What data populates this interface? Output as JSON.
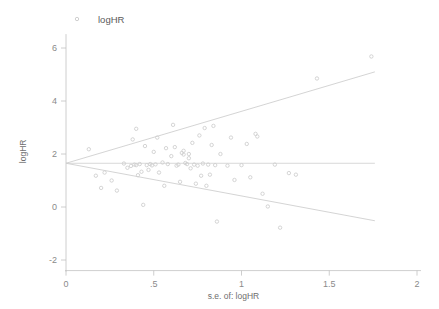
{
  "chart_data": {
    "type": "scatter",
    "title": "",
    "subtitle": "",
    "xlabel": "s.e. of: logHR",
    "ylabel": "logHR",
    "xlim": [
      0,
      2
    ],
    "ylim": [
      -2.4,
      6.6
    ],
    "xticks": [
      0,
      0.5,
      1,
      1.5,
      2
    ],
    "xtick_labels": [
      "0",
      ".5",
      "1",
      "1.5",
      "2"
    ],
    "yticks": [
      -2,
      0,
      2,
      4,
      6
    ],
    "ytick_labels": [
      "-2",
      "0",
      "2",
      "4",
      "6"
    ],
    "grid": false,
    "legend": {
      "position": "top-left",
      "entries": [
        {
          "label": "logHR",
          "marker": "circle",
          "color": "#c9c9c9"
        }
      ]
    },
    "marker": {
      "shape": "circle-open",
      "color": "#cfcfcf",
      "size": 3.4
    },
    "reference_lines": [
      {
        "name": "pooled-effect-line",
        "kind": "horizontal",
        "y": 1.65,
        "x_start": 0.0,
        "x_end": 1.76,
        "color": "#cfcfcf"
      },
      {
        "name": "pseudo-95-ci-upper",
        "kind": "diagonal",
        "x_start": 0.0,
        "y_start": 1.65,
        "x_end": 1.76,
        "y_end": 5.1,
        "color": "#cfcfcf"
      },
      {
        "name": "pseudo-95-ci-lower",
        "kind": "diagonal",
        "x_start": 0.0,
        "y_start": 1.65,
        "x_end": 1.76,
        "y_end": -0.52,
        "color": "#cfcfcf"
      }
    ],
    "series": [
      {
        "name": "logHR",
        "points": [
          [
            0.13,
            2.18
          ],
          [
            0.17,
            1.18
          ],
          [
            0.2,
            0.72
          ],
          [
            0.22,
            1.3
          ],
          [
            0.26,
            1.0
          ],
          [
            0.29,
            0.62
          ],
          [
            0.33,
            1.64
          ],
          [
            0.35,
            1.48
          ],
          [
            0.37,
            1.55
          ],
          [
            0.38,
            2.55
          ],
          [
            0.39,
            1.6
          ],
          [
            0.4,
            2.95
          ],
          [
            0.4,
            1.58
          ],
          [
            0.41,
            1.2
          ],
          [
            0.42,
            1.62
          ],
          [
            0.43,
            1.33
          ],
          [
            0.44,
            0.08
          ],
          [
            0.45,
            2.3
          ],
          [
            0.46,
            1.58
          ],
          [
            0.47,
            1.4
          ],
          [
            0.48,
            1.62
          ],
          [
            0.49,
            1.57
          ],
          [
            0.5,
            2.08
          ],
          [
            0.51,
            1.61
          ],
          [
            0.52,
            2.62
          ],
          [
            0.53,
            1.3
          ],
          [
            0.55,
            1.68
          ],
          [
            0.56,
            0.8
          ],
          [
            0.57,
            2.22
          ],
          [
            0.58,
            1.62
          ],
          [
            0.6,
            1.92
          ],
          [
            0.61,
            3.1
          ],
          [
            0.62,
            2.26
          ],
          [
            0.63,
            1.56
          ],
          [
            0.64,
            1.6
          ],
          [
            0.65,
            0.95
          ],
          [
            0.66,
            2.04
          ],
          [
            0.67,
            1.98
          ],
          [
            0.67,
            2.12
          ],
          [
            0.68,
            1.66
          ],
          [
            0.69,
            1.62
          ],
          [
            0.7,
            2.0
          ],
          [
            0.7,
            1.84
          ],
          [
            0.71,
            1.46
          ],
          [
            0.72,
            2.42
          ],
          [
            0.73,
            1.6
          ],
          [
            0.74,
            0.88
          ],
          [
            0.75,
            1.56
          ],
          [
            0.76,
            2.7
          ],
          [
            0.77,
            1.18
          ],
          [
            0.78,
            1.64
          ],
          [
            0.79,
            2.98
          ],
          [
            0.8,
            0.8
          ],
          [
            0.81,
            1.6
          ],
          [
            0.82,
            1.22
          ],
          [
            0.83,
            2.34
          ],
          [
            0.84,
            3.06
          ],
          [
            0.85,
            1.58
          ],
          [
            0.86,
            -0.55
          ],
          [
            0.88,
            2.0
          ],
          [
            0.92,
            1.56
          ],
          [
            0.94,
            2.62
          ],
          [
            0.96,
            1.02
          ],
          [
            1.0,
            1.58
          ],
          [
            1.03,
            2.38
          ],
          [
            1.05,
            1.12
          ],
          [
            1.08,
            2.76
          ],
          [
            1.09,
            2.66
          ],
          [
            1.12,
            0.5
          ],
          [
            1.15,
            0.02
          ],
          [
            1.19,
            1.6
          ],
          [
            1.22,
            -0.78
          ],
          [
            1.27,
            1.28
          ],
          [
            1.31,
            1.22
          ],
          [
            1.43,
            4.85
          ],
          [
            1.74,
            5.68
          ]
        ]
      }
    ]
  }
}
